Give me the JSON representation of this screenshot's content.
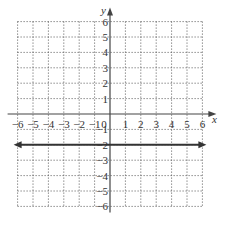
{
  "chart_data": {
    "type": "line",
    "title": "",
    "xlabel": "x",
    "ylabel": "y",
    "xlim": [
      -6,
      6
    ],
    "ylim": [
      -6,
      6
    ],
    "grid": true,
    "grid_style": "dotted",
    "x_ticks": [
      "-6",
      "-5",
      "-4",
      "-3",
      "-2",
      "-1",
      "0",
      "1",
      "2",
      "3",
      "4",
      "5",
      "6"
    ],
    "y_ticks": [
      "6",
      "5",
      "4",
      "3",
      "2",
      "1",
      "-1",
      "-2",
      "-3",
      "-4",
      "-5",
      "-6"
    ],
    "series": [
      {
        "name": "y = -2",
        "type": "horizontal-line",
        "x": [
          -6,
          6
        ],
        "y": [
          -2,
          -2
        ],
        "arrows": "both"
      }
    ],
    "legend": null
  },
  "labels": {
    "x_axis": "x",
    "y_axis": "y"
  }
}
